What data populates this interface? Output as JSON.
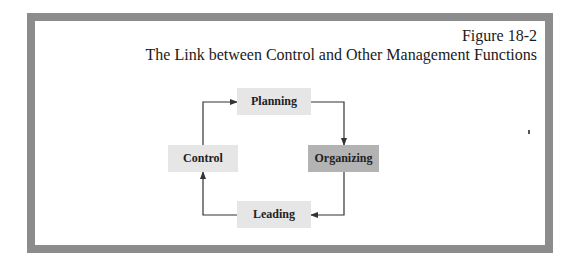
{
  "figure": {
    "number": "Figure 18-2",
    "title": "The Link between Control and Other Management Functions"
  },
  "diagram": {
    "nodes": [
      {
        "id": "planning",
        "label": "Planning",
        "shade": "light"
      },
      {
        "id": "organizing",
        "label": "Organizing",
        "shade": "dark"
      },
      {
        "id": "leading",
        "label": "Leading",
        "shade": "light"
      },
      {
        "id": "control",
        "label": "Control",
        "shade": "light"
      }
    ],
    "edges": [
      {
        "from": "planning",
        "to": "organizing"
      },
      {
        "from": "organizing",
        "to": "leading"
      },
      {
        "from": "leading",
        "to": "control"
      },
      {
        "from": "control",
        "to": "planning"
      }
    ]
  },
  "colors": {
    "frame_border": "#8c8c8c",
    "box_light": "#e6e6e6",
    "box_dark": "#b3b3b3",
    "line": "#333333"
  }
}
